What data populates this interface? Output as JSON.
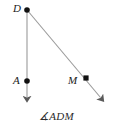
{
  "figure": {
    "type": "geometry-diagram",
    "caption": "∡ADM",
    "background_color": "#ffffff",
    "line_color": "#8c8c8c",
    "point_color": "#111111",
    "label_color": "#1a1a1a"
  },
  "points": [
    {
      "name": "D",
      "label": "D",
      "x": 27,
      "y": 10,
      "role": "vertex"
    },
    {
      "name": "A",
      "label": "A",
      "x": 27,
      "y": 81,
      "role": "ray-point"
    },
    {
      "name": "M",
      "label": "M",
      "x": 86,
      "y": 78,
      "role": "ray-point"
    }
  ],
  "rays": [
    {
      "name": "ray-DA",
      "from": "D",
      "through": "A",
      "arrow_tip_x": 27,
      "arrow_tip_y": 101
    },
    {
      "name": "ray-DM",
      "from": "D",
      "through": "M",
      "arrow_tip_x": 104,
      "arrow_tip_y": 101
    }
  ]
}
